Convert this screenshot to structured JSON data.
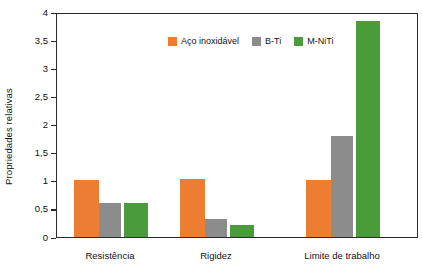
{
  "chart_data": {
    "type": "bar",
    "title": "",
    "xlabel": "",
    "ylabel": "Propriedades relativas",
    "categories": [
      "Resistência",
      "Rigidez",
      "Limite de trabalho"
    ],
    "series": [
      {
        "name": "Aço inoxidável",
        "color": "#ed7d31",
        "values": [
          1.02,
          1.03,
          1.02
        ]
      },
      {
        "name": "B-Ti",
        "color": "#8c8c8c",
        "values": [
          0.6,
          0.32,
          1.8
        ]
      },
      {
        "name": "M-NiTi",
        "color": "#4a9b3c",
        "values": [
          0.6,
          0.21,
          3.84
        ]
      }
    ],
    "ylim": [
      0,
      4
    ],
    "yticks": [
      0,
      0.5,
      1,
      1.5,
      2,
      2.5,
      3,
      3.5,
      4
    ],
    "ytick_labels": [
      "0",
      "0,5",
      "1",
      "1,5",
      "2",
      "2,5",
      "3",
      "3,5",
      "4"
    ],
    "grid": false,
    "legend_position": "top-center",
    "legend_entries": [
      "Aço inoxidável",
      "B-Ti",
      "M-NiTi"
    ]
  },
  "axis": {
    "y_title": "Propriedades relativas"
  },
  "legend": {
    "items": [
      {
        "label": "Aço inoxidável"
      },
      {
        "label": "B-Ti"
      },
      {
        "label": "M-NiTi"
      }
    ]
  },
  "categories": [
    {
      "label": "Resistência"
    },
    {
      "label": "Rigidez"
    },
    {
      "label": "Limite de trabalho"
    }
  ],
  "yticks": [
    {
      "label": "4"
    },
    {
      "label": "3,5"
    },
    {
      "label": "3"
    },
    {
      "label": "2,5"
    },
    {
      "label": "2"
    },
    {
      "label": "1,5"
    },
    {
      "label": "1"
    },
    {
      "label": "0,5"
    },
    {
      "label": "0"
    }
  ]
}
